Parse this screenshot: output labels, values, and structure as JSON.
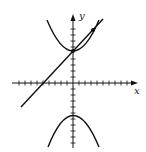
{
  "diagram": {
    "type": "coordinate-plot",
    "axes": {
      "x_label": "x",
      "y_label": "y",
      "tick_spacing_px": 6,
      "origin_px": [
        73,
        83
      ]
    },
    "curves": [
      {
        "name": "hyperbola-upper-branch",
        "equation": "y^2 - x^2 = 25",
        "vertex": [
          0,
          5
        ]
      },
      {
        "name": "hyperbola-lower-branch",
        "equation": "y^2 - x^2 = 25",
        "vertex": [
          0,
          -5
        ]
      },
      {
        "name": "secant-line",
        "equation": "y = x + 5"
      }
    ],
    "points": [
      {
        "name": "upper-vertex",
        "px": [
          73,
          51
        ]
      },
      {
        "name": "second-intersection",
        "px": [
          93,
          30
        ]
      }
    ],
    "colors": {
      "stroke": "#111111",
      "background": "#ffffff"
    }
  }
}
